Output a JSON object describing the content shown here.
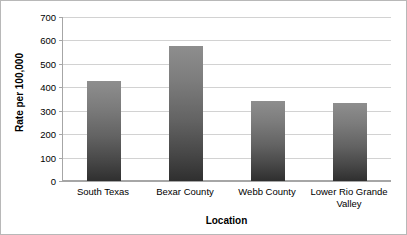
{
  "chart_data": {
    "type": "bar",
    "title": "",
    "categories": [
      "South Texas",
      "Bexar County",
      "Webb County",
      "Lower Rio Grande Valley"
    ],
    "values": [
      425,
      578,
      340,
      332
    ],
    "series": [
      {
        "name": "Rate per 100,000",
        "values": [
          425,
          578,
          340,
          332
        ]
      }
    ],
    "xlabel": "Location",
    "ylabel": "Rate per 100,000",
    "ylim": [
      0,
      700
    ],
    "ytick_step": 100,
    "yticks": [
      700,
      600,
      500,
      400,
      300,
      200,
      100,
      0
    ],
    "ytick_labels": [
      "700",
      "600",
      "500",
      "400",
      "300",
      "200",
      "100",
      "0"
    ],
    "grid": "horizontal",
    "legend": "none",
    "orientation": "vertical",
    "bar_color_top": "#8e8e8e",
    "bar_color_bottom": "#2f2f2f",
    "gridline_color": "#d2d2d2",
    "axis_color": "#a6a6a6",
    "background_color": "#ffffff"
  }
}
